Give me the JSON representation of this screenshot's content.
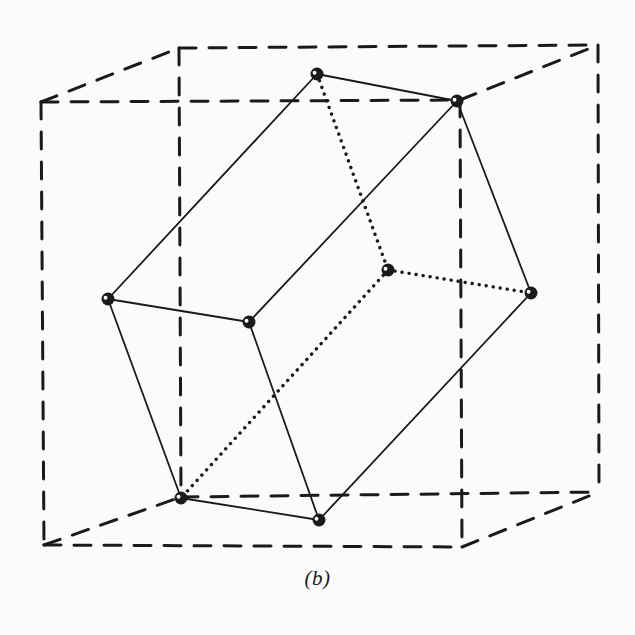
{
  "figure": {
    "caption": "(b)",
    "caption_paren_open": "(",
    "caption_letter": "b",
    "caption_paren_close": ")",
    "background_color": "#fbfbf9",
    "ink_color": "#1a1a1a"
  },
  "chart_data": {
    "type": "diagram",
    "title": "(b)",
    "view": {
      "width": 635,
      "height": 635
    },
    "style": {
      "solid_edge": {
        "stroke": "#1a1a1a",
        "width": 1.8,
        "dash": "none"
      },
      "hidden_edge": {
        "stroke": "#1a1a1a",
        "width": 3.4,
        "dash": "0.1,7"
      },
      "cube_edge": {
        "stroke": "#1a1a1a",
        "width": 3.0,
        "dash": "17,13"
      },
      "vertex": {
        "fill": "#1a1a1a",
        "radius": 6.5,
        "highlight": "#ffffff"
      }
    },
    "cube_vertices": {
      "front_top_left": [
        41,
        102
      ],
      "front_top_right": [
        460,
        100
      ],
      "back_top_left": [
        179,
        48
      ],
      "back_top_right": [
        598,
        45
      ],
      "front_bottom_left": [
        44,
        545
      ],
      "front_bottom_right": [
        462,
        547
      ],
      "back_bottom_left": [
        181,
        497
      ],
      "back_bottom_right": [
        599,
        492
      ]
    },
    "cube_edges": [
      [
        "front_top_left",
        "front_top_right"
      ],
      [
        "front_top_left",
        "front_bottom_left"
      ],
      [
        "front_top_right",
        "front_bottom_right"
      ],
      [
        "front_bottom_left",
        "front_bottom_right"
      ],
      [
        "back_top_left",
        "back_top_right"
      ],
      [
        "back_top_left",
        "back_bottom_left"
      ],
      [
        "back_top_right",
        "back_bottom_right"
      ],
      [
        "back_bottom_left",
        "back_bottom_right"
      ],
      [
        "front_top_left",
        "back_top_left"
      ],
      [
        "front_top_right",
        "back_top_right"
      ],
      [
        "front_bottom_left",
        "back_bottom_left"
      ],
      [
        "front_bottom_right",
        "back_bottom_right"
      ]
    ],
    "poly_vertices": {
      "v_top": [
        317,
        74
      ],
      "v_top_right": [
        457,
        101
      ],
      "v_left": [
        108,
        299
      ],
      "v_mid_left": [
        249,
        322
      ],
      "v_center": [
        388,
        270
      ],
      "v_right": [
        531,
        293
      ],
      "v_bottom_left": [
        181,
        498
      ],
      "v_bottom_mid": [
        319,
        520
      ]
    },
    "poly_solid_edges": [
      [
        "v_top",
        "v_top_right"
      ],
      [
        "v_top",
        "v_left"
      ],
      [
        "v_left",
        "v_mid_left"
      ],
      [
        "v_mid_left",
        "v_top_right"
      ],
      [
        "v_left",
        "v_bottom_left"
      ],
      [
        "v_mid_left",
        "v_bottom_mid"
      ],
      [
        "v_bottom_left",
        "v_bottom_mid"
      ],
      [
        "v_bottom_mid",
        "v_right"
      ],
      [
        "v_right",
        "v_top_right"
      ]
    ],
    "poly_dotted_edges": [
      [
        "v_top",
        "v_center"
      ],
      [
        "v_center",
        "v_right"
      ],
      [
        "v_center",
        "v_bottom_left"
      ]
    ],
    "vertex_count": 8,
    "solid_edge_count": 9,
    "dotted_edge_count": 3,
    "cube_edge_count": 12
  }
}
